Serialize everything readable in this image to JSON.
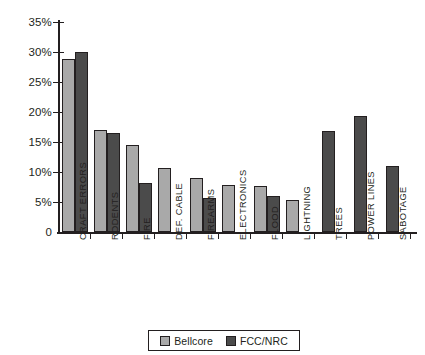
{
  "chart_data": {
    "type": "bar",
    "title": "",
    "subtitle": "",
    "xlabel": "",
    "ylabel": "",
    "ylim": [
      0,
      35
    ],
    "ytick_values": [
      35,
      30,
      25,
      20,
      15,
      10,
      5,
      0
    ],
    "ytick_labels": [
      "35%",
      "30%",
      "25%",
      "20%",
      "15%",
      "10%",
      "5%",
      "0"
    ],
    "grid": false,
    "legend_position": "bottom-center",
    "categories": [
      "CRAFT ERRORS",
      "RODENTS",
      "FIRE",
      "DEF. CABLE",
      "FIREARMS",
      "ELECTRONICS",
      "FLOOD",
      "LIGHTNING",
      "TREES",
      "POWER LINES",
      "SABOTAGE"
    ],
    "series": [
      {
        "name": "Bellcore",
        "color": "#a9a9a9",
        "values": [
          28.8,
          17.0,
          14.5,
          10.7,
          9.0,
          7.8,
          7.6,
          5.3,
          null,
          null,
          null
        ]
      },
      {
        "name": "FCC/NRC",
        "color": "#4b4b4b",
        "values": [
          30.0,
          16.5,
          8.1,
          null,
          5.7,
          null,
          6.0,
          null,
          16.8,
          19.3,
          11.0
        ]
      }
    ]
  },
  "legend": {
    "items": [
      {
        "label": "Bellcore",
        "swatch": "light-gray-swatch"
      },
      {
        "label": "FCC/NRC",
        "swatch": "dark-gray-swatch"
      }
    ]
  }
}
